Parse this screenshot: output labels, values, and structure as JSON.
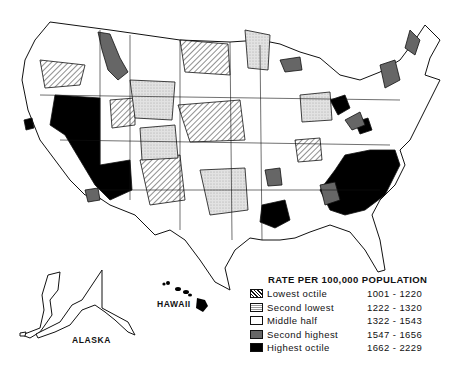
{
  "map": {
    "subject": "Rate per 100,000 population by area, United States",
    "regions_labeled": [
      "ALASKA",
      "HAWAII"
    ]
  },
  "labels": {
    "alaska": "ALASKA",
    "hawaii": "HAWAII"
  },
  "legend": {
    "title": "RATE PER 100,000 POPULATION",
    "items": [
      {
        "label": "Lowest octile",
        "range": "1001 - 1220",
        "pattern": "diagonal-hatch"
      },
      {
        "label": "Second lowest",
        "range": "1222 - 1320",
        "pattern": "light-stipple"
      },
      {
        "label": "Middle half",
        "range": "1322 - 1543",
        "pattern": "white"
      },
      {
        "label": "Second highest",
        "range": "1547 - 1656",
        "pattern": "dark-gray"
      },
      {
        "label": "Highest octile",
        "range": "1662 - 2229",
        "pattern": "black"
      }
    ]
  },
  "colors": {
    "lowest": "#ffffff/hatched",
    "second_lowest": "#dcdcdc",
    "middle": "#ffffff",
    "second_highest": "#666666",
    "highest": "#000000"
  }
}
